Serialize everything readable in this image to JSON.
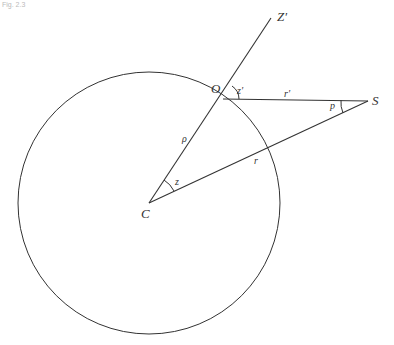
{
  "figure": {
    "corner_text": "Fig. 2.3",
    "points": {
      "C": {
        "label": "C",
        "x": 149,
        "y": 203
      },
      "O": {
        "label": "O",
        "x": 223,
        "y": 99
      },
      "S": {
        "label": "S",
        "x": 368,
        "y": 101
      },
      "Zp": {
        "label": "Z'",
        "x": 271,
        "y": 18
      }
    },
    "circle": {
      "cx": 149,
      "cy": 203,
      "r": 131
    },
    "labels": {
      "Z_prime": "Z′",
      "O": "O",
      "S": "S",
      "C": "C",
      "z_prime": "z′",
      "r_prime": "r′",
      "p": "p",
      "rho": "ρ",
      "r": "r",
      "z": "z"
    },
    "colors": {
      "line": "#333333",
      "background": "#ffffff"
    }
  }
}
